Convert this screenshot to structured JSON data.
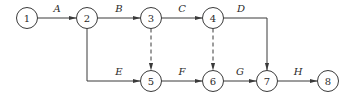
{
  "diagram": {
    "type": "activity-on-arrow network",
    "nodes": [
      {
        "id": "1",
        "label": "1"
      },
      {
        "id": "2",
        "label": "2"
      },
      {
        "id": "3",
        "label": "3"
      },
      {
        "id": "4",
        "label": "4"
      },
      {
        "id": "5",
        "label": "5"
      },
      {
        "id": "6",
        "label": "6"
      },
      {
        "id": "7",
        "label": "7"
      },
      {
        "id": "8",
        "label": "8"
      }
    ],
    "edges": [
      {
        "from": "1",
        "to": "2",
        "label": "A",
        "style": "solid"
      },
      {
        "from": "2",
        "to": "3",
        "label": "B",
        "style": "solid"
      },
      {
        "from": "3",
        "to": "4",
        "label": "C",
        "style": "solid"
      },
      {
        "from": "4",
        "to": "7",
        "label": "D",
        "style": "solid"
      },
      {
        "from": "2",
        "to": "5",
        "label": "E",
        "style": "solid"
      },
      {
        "from": "5",
        "to": "6",
        "label": "F",
        "style": "solid"
      },
      {
        "from": "6",
        "to": "7",
        "label": "G",
        "style": "solid"
      },
      {
        "from": "7",
        "to": "8",
        "label": "H",
        "style": "solid"
      },
      {
        "from": "3",
        "to": "5",
        "label": "",
        "style": "dashed"
      },
      {
        "from": "4",
        "to": "6",
        "label": "",
        "style": "dashed"
      }
    ]
  }
}
